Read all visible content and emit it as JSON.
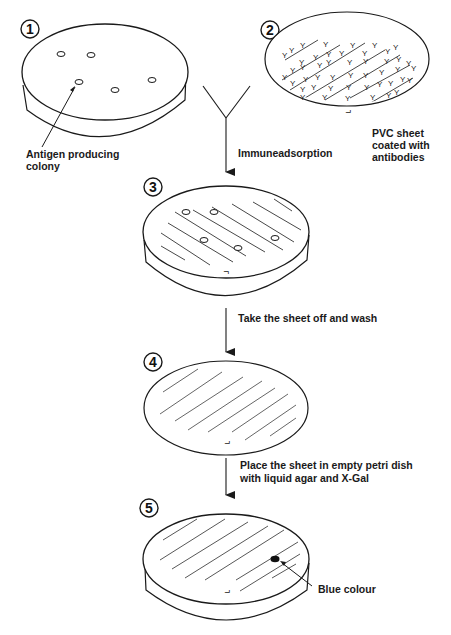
{
  "diagram": {
    "stroke_color": "#1a1a1a",
    "hatch_color": "#555555",
    "blue_dot_color": "#111111",
    "steps": [
      {
        "number": "1",
        "caption_lines": [
          "Antigen producing",
          "colony"
        ],
        "object": "petri dish with colonies"
      },
      {
        "number": "2",
        "caption_lines": [
          "PVC sheet",
          "coated with",
          "antibodies"
        ],
        "object": "PVC sheet with antibodies"
      },
      {
        "number": "3",
        "caption_lines": [],
        "object": "petri dish with PVC sheet applied"
      },
      {
        "number": "4",
        "caption_lines": [],
        "object": "washed PVC sheet"
      },
      {
        "number": "5",
        "caption_lines": [
          "Blue colour"
        ],
        "object": "sheet in petri dish with agar and X-Gal"
      }
    ],
    "arrows": [
      {
        "from": "antibody",
        "to": "3",
        "label_lines": [
          "Immuneadsorption"
        ]
      },
      {
        "from": "3",
        "to": "4",
        "label_lines": [
          "Take the sheet off and wash"
        ]
      },
      {
        "from": "4",
        "to": "5",
        "label_lines": [
          "Place the sheet in empty petri dish",
          "with liquid agar and  X-Gal"
        ]
      }
    ],
    "antibody_glyph": "Y",
    "orientation_mark": "⌐"
  }
}
